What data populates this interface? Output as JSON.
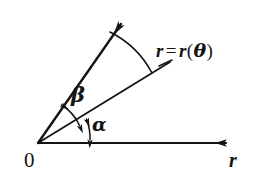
{
  "figure": {
    "type": "polar-angle-diagram",
    "background_color": "#ffffff",
    "ink_color": "#141414",
    "labels": {
      "origin": "0",
      "axis_r": "r",
      "angle_alpha": "α",
      "angle_beta": "β",
      "curve_r": "r",
      "curve_equals": "=",
      "curve_r2": "r",
      "curve_paren_open": "(",
      "curve_theta": "θ",
      "curve_paren_close": ")"
    },
    "elements": {
      "origin_point": "vertex at origin where all rays meet",
      "polar_axis": "horizontal ray labelled r with arrowhead at right",
      "tangent_ray": "long ray with arrowhead, upper ray subtending beta",
      "radius_vector": "middle ray pointing to the curve r = r(theta)",
      "alpha_arc": "double-headed arc between polar axis and radius vector",
      "beta_arc": "double-headed arc between radius vector and tangent ray",
      "theta_arc": "large open arc from tangent ray to radius vector",
      "leader_line": "short line connecting the r = r(theta) label to the radius vector"
    },
    "geometry": {
      "origin": [
        38,
        143
      ],
      "axis_tip": [
        234,
        143
      ],
      "tangent_tip": [
        117,
        17
      ],
      "radius_tip": [
        170,
        62
      ],
      "alpha_degrees": 24,
      "beta_degrees": 35,
      "tangent_degrees": 59
    }
  }
}
